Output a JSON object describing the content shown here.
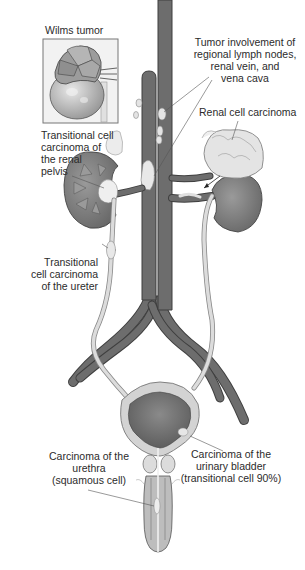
{
  "diagram": {
    "colors": {
      "vessel": "#6d6d6d",
      "vessel_outline": "#3f3f3f",
      "kidney": "#7a7a7a",
      "ureter": "#d9d9d9",
      "tumor": "#e6e6e6",
      "bladder_wall": "#cfcfcf",
      "bladder_inner": "#777777",
      "label_text": "#2b2b2b",
      "leader_line": "#555555"
    },
    "labels": {
      "wilms": {
        "line1": "Wilms tumor"
      },
      "lymph": {
        "line1": "Tumor involvement of",
        "line2": "regional lymph nodes,",
        "line3": "renal vein, and",
        "line4": "vena cava"
      },
      "renal_cell": {
        "line1": "Renal cell carcinoma"
      },
      "renal_pelvis": {
        "line1": "Transitional cell",
        "line2": "carcinoma of",
        "line3": "the renal",
        "line4": "pelvis"
      },
      "ureter": {
        "line1": "Transitional",
        "line2": "cell carcinoma",
        "line3": "of the ureter"
      },
      "urethra": {
        "line1": "Carcinoma of the",
        "line2": "urethra",
        "line3": "(squamous cell)"
      },
      "bladder": {
        "line1": "Carcinoma of the",
        "line2": "urinary bladder",
        "line3": "(transitional cell 90%)"
      }
    },
    "structures": [
      "wilms-tumor-inset",
      "aorta",
      "inferior-vena-cava",
      "left-kidney",
      "right-kidney",
      "ureters",
      "iliac-vessels",
      "urinary-bladder",
      "prostate",
      "urethra"
    ]
  }
}
